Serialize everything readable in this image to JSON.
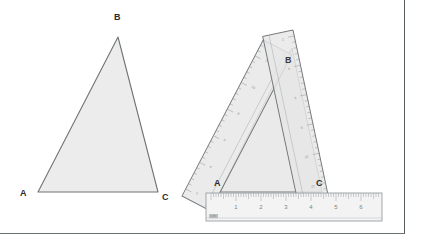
{
  "figure": {
    "title_visible": false,
    "background_color": "#ffffff",
    "frame": {
      "right_rule_color": "#555a5d",
      "bottom_rule_color": "#6a6f72"
    }
  },
  "left_figure": {
    "name": "plain-triangle",
    "description": "Shaded triangle ABC drawn alone",
    "fill_color": "#ececec",
    "stroke_color": "#6e7376",
    "vertices": [
      {
        "id": "B",
        "label": "B",
        "x": 118,
        "y": 37,
        "label_x": 115,
        "label_y": 15
      },
      {
        "id": "A",
        "label": "A",
        "x": 38,
        "y": 192,
        "label_x": 20,
        "label_y": 190
      },
      {
        "id": "C",
        "label": "C",
        "x": 158,
        "y": 192,
        "label_x": 163,
        "label_y": 193
      }
    ]
  },
  "right_figure": {
    "name": "triangle-with-rulers",
    "description": "Same triangle ABC constructed with two tilted rulers resting on a horizontal centimetre ruler",
    "triangle": {
      "fill_color": "#e9e9e9",
      "stroke_color": "#6e7376",
      "vertices": [
        {
          "id": "B",
          "label": "B",
          "x": 292,
          "y": 48,
          "label_x": 285,
          "label_y": 57
        },
        {
          "id": "A",
          "label": "A",
          "x": 220,
          "y": 192,
          "label_x": 215,
          "label_y": 180
        },
        {
          "id": "C",
          "label": "C",
          "x": 322,
          "y": 192,
          "label_x": 317,
          "label_y": 180
        }
      ]
    },
    "rulers": [
      {
        "name": "left-tilted-ruler",
        "orientation": "tilted",
        "fill_color": "#e4e4e4",
        "edge_color": "#6e7376",
        "tick_color": "#8a8f92",
        "tick_numbers": [
          "2",
          "4",
          "6",
          "8",
          "10",
          "12"
        ]
      },
      {
        "name": "right-tilted-ruler",
        "orientation": "tilted",
        "fill_color": "#e4e4e4",
        "edge_color": "#6e7376",
        "tick_color": "#8a8f92",
        "tick_numbers": [
          "2",
          "4",
          "6",
          "8",
          "10",
          "12"
        ]
      }
    ],
    "base_ruler": {
      "name": "horizontal-ruler",
      "unit_label": "cm",
      "fill_color": "#f3f3f3",
      "edge_color": "#9a9fa2",
      "tick_color": "#9a9fa2",
      "numbers": [
        "1",
        "2",
        "3",
        "4",
        "5",
        "6"
      ]
    }
  }
}
